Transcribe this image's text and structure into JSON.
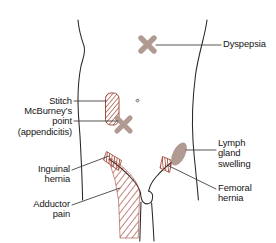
{
  "figure": {
    "type": "anatomical-illustration",
    "view": "anterior lower abdomen, groin and upper thighs"
  },
  "palette": {
    "hatch_red": "#9b3b2a",
    "marker_taupe": "#b09a92",
    "outline": "#2a2724",
    "leader_line": "#3a3633",
    "text": "#151515",
    "background": "#ffffff"
  },
  "labels": {
    "dyspepsia": "Dyspepsia",
    "stitch": "Stitch",
    "mcburney": "McBurney’s\npoint\n(appendicitis)",
    "inguinal": "Inguinal\nhernia",
    "adductor": "Adductor\npain",
    "lymph": "Lymph\ngland\nswelling",
    "femoral": "Femoral\nhernia"
  },
  "markers": [
    {
      "name": "dyspepsia-marker",
      "glyph": "x-cross",
      "color": "#b09a92",
      "site": "epigastrium",
      "label": "Dyspepsia"
    },
    {
      "name": "stitch-marker",
      "glyph": "hatched-rectangle",
      "color": "#9b3b2a",
      "site": "right lower lateral abdomen",
      "label": "Stitch"
    },
    {
      "name": "mcburney-marker",
      "glyph": "x-cross",
      "color": "#b09a92",
      "site": "right iliac fossa",
      "label": "McBurney’s point (appendicitis)"
    },
    {
      "name": "inguinal-hernia-marker",
      "glyph": "vertical-hatch-band",
      "color": "#9b3b2a",
      "site": "right inguinal canal",
      "label": "Inguinal hernia"
    },
    {
      "name": "adductor-pain-marker",
      "glyph": "diagonal-hatch-field",
      "color": "#9b3b2a",
      "site": "medial upper thigh",
      "label": "Adductor pain"
    },
    {
      "name": "femoral-hernia-marker",
      "glyph": "vertical-hatch-band",
      "color": "#9b3b2a",
      "site": "left femoral canal",
      "label": "Femoral hernia"
    },
    {
      "name": "lymph-gland-marker",
      "glyph": "tilted-oval",
      "color": "#b09a92",
      "site": "left inguinal lymph nodes",
      "label": "Lymph gland swelling"
    },
    {
      "name": "navel-marker",
      "glyph": "small-dot",
      "color": "#6b625c",
      "site": "umbilicus",
      "label": ""
    }
  ]
}
